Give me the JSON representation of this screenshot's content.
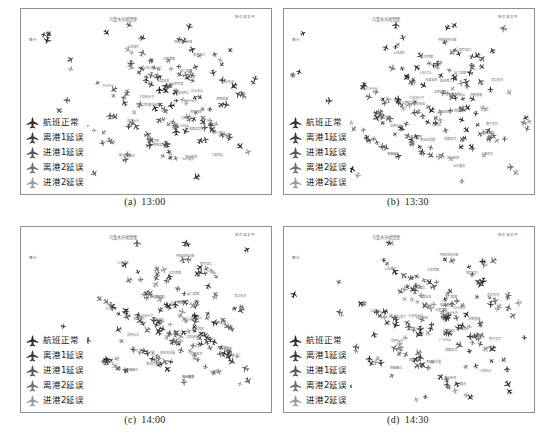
{
  "figure": {
    "type": "four-panel-flight-distribution-map",
    "background_color": "#ffffff",
    "frame_color": "#8f8f8f"
  },
  "legend": {
    "items": [
      {
        "icon": "airplane-icon",
        "label": "航班正常",
        "color": "#2b2b2b"
      },
      {
        "icon": "airplane-icon",
        "label": "离港1延误",
        "color": "#3c3c3c"
      },
      {
        "icon": "airplane-icon",
        "label": "进港1延误",
        "color": "#565656"
      },
      {
        "icon": "airplane-icon",
        "label": "离港2延误",
        "color": "#6f6f6f"
      },
      {
        "icon": "airplane-icon",
        "label": "进港2延误",
        "color": "#9a9a9a"
      }
    ]
  },
  "panels": [
    {
      "id": "a",
      "caption_label": "(a)",
      "caption_time": "13:00",
      "map_title": "乌鲁木齐地窝堡",
      "corner_label": "哈尔滨太平",
      "left_label": "喀什",
      "aircraft_count": 148,
      "labels": [
        "呼和浩特白塔",
        "北京首都",
        "天津滨海",
        "大连周水子",
        "沈阳桃仙",
        "济南遥墙",
        "青岛流亭",
        "郑州新郑",
        "西安咸阳",
        "兰州中川",
        "成都双流",
        "重庆江北",
        "武汉天河",
        "长沙黄花",
        "南昌昌北",
        "杭州萧山",
        "上海浦东",
        "上海虹桥",
        "南京禄口",
        "厦门高崎",
        "福州长乐",
        "广州白云",
        "深圳宝安",
        "桂林两江",
        "昆明长水",
        "贵阳龙洞堡",
        "南宁吴圩",
        "海口美兰",
        "三亚凤凰",
        "拉萨贡嘎"
      ]
    },
    {
      "id": "b",
      "caption_label": "(b)",
      "caption_time": "13:30",
      "map_title": "乌鲁木齐地窝堡",
      "corner_label": "哈尔滨太平",
      "left_label": "喀什",
      "aircraft_count": 163,
      "labels": [
        "呼和浩特白塔",
        "北京首都",
        "天津滨海",
        "大连周水子",
        "沈阳桃仙",
        "济南遥墙",
        "青岛流亭",
        "郑州新郑",
        "西安咸阳",
        "兰州中川",
        "成都双流",
        "重庆江北",
        "武汉天河",
        "长沙黄花",
        "南昌昌北",
        "杭州萧山",
        "上海浦东",
        "上海虹桥",
        "南京禄口",
        "厦门高崎",
        "福州长乐",
        "广州白云",
        "深圳宝安",
        "桂林两江",
        "昆明长水",
        "贵阳龙洞堡",
        "南宁吴圩",
        "海口美兰",
        "三亚凤凰",
        "拉萨贡嘎"
      ]
    },
    {
      "id": "c",
      "caption_label": "(c)",
      "caption_time": "14:00",
      "map_title": "乌鲁木齐地窝堡",
      "corner_label": "哈尔滨太平",
      "left_label": "喀什",
      "aircraft_count": 171,
      "labels": [
        "呼和浩特白塔",
        "北京首都",
        "天津滨海",
        "大连周水子",
        "沈阳桃仙",
        "济南遥墙",
        "青岛流亭",
        "郑州新郑",
        "西安咸阳",
        "兰州中川",
        "成都双流",
        "重庆江北",
        "武汉天河",
        "长沙黄花",
        "南昌昌北",
        "杭州萧山",
        "上海浦东",
        "上海虹桥",
        "南京禄口",
        "厦门高崎",
        "福州长乐",
        "广州白云",
        "深圳宝安",
        "桂林两江",
        "昆明长水",
        "贵阳龙洞堡",
        "南宁吴圩",
        "海口美兰",
        "三亚凤凰",
        "拉萨贡嘎"
      ]
    },
    {
      "id": "d",
      "caption_label": "(d)",
      "caption_time": "14:30",
      "map_title": "乌鲁木齐地窝堡",
      "corner_label": "哈尔滨太平",
      "left_label": "喀什",
      "aircraft_count": 158,
      "labels": [
        "呼和浩特白塔",
        "北京首都",
        "天津滨海",
        "大连周水子",
        "沈阳桃仙",
        "济南遥墙",
        "青岛流亭",
        "郑州新郑",
        "西安咸阳",
        "兰州中川",
        "成都双流",
        "重庆江北",
        "武汉天河",
        "长沙黄花",
        "南昌昌北",
        "杭州萧山",
        "上海浦东",
        "上海虹桥",
        "南京禄口",
        "厦门高崎",
        "福州长乐",
        "广州白云",
        "深圳宝安",
        "桂林两江",
        "昆明长水",
        "贵阳龙洞堡",
        "南宁吴圩",
        "海口美兰",
        "三亚凤凰",
        "拉萨贡嘎"
      ]
    }
  ]
}
